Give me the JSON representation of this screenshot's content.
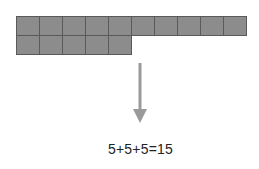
{
  "diagram": {
    "rows": [
      {
        "cells": 10
      },
      {
        "cells": 5
      }
    ],
    "colors": {
      "cell_fill": "#8c8c8c",
      "cell_border": "#5a5a5a",
      "arrow": "#9a9a9a",
      "text": "#222222"
    },
    "arrow_direction": "down",
    "equation": "5+5+5=15"
  }
}
